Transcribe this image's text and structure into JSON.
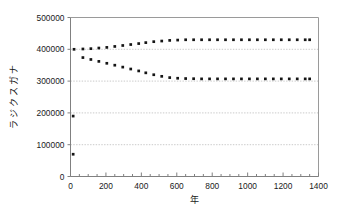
{
  "chart_data": {
    "type": "scatter",
    "title": "",
    "xlabel": "年",
    "ylabel": "ナガスクジラ",
    "xlim": [
      0,
      1400
    ],
    "ylim": [
      0,
      500000
    ],
    "xticks": [
      0,
      200,
      400,
      600,
      800,
      1000,
      1200,
      1400
    ],
    "xtick_labels": [
      "0",
      "200",
      "400",
      "600",
      "800",
      "1000",
      "1200",
      "1400"
    ],
    "yticks": [
      0,
      100000,
      200000,
      300000,
      400000,
      500000
    ],
    "ytick_labels": [
      "0",
      "100000",
      "200000",
      "300000",
      "400000",
      "500000"
    ],
    "grid": "horizontal-dotted",
    "legend": "none",
    "marker": "filled-square",
    "marker_color": "#151515",
    "series": [
      {
        "name": "upper-trajectory",
        "x": [
          20,
          70,
          115,
          160,
          205,
          250,
          295,
          340,
          385,
          425,
          470,
          515,
          560,
          605,
          650,
          695,
          740,
          785,
          830,
          875,
          920,
          965,
          1010,
          1055,
          1100,
          1145,
          1190,
          1235,
          1280,
          1325,
          1350
        ],
        "y": [
          400000,
          401000,
          402000,
          404000,
          406000,
          409000,
          412000,
          415000,
          418000,
          421000,
          424000,
          426000,
          428000,
          429000,
          430000,
          430000,
          430000,
          430000,
          430000,
          430000,
          430000,
          430000,
          430000,
          430000,
          430000,
          430000,
          430000,
          430000,
          430000,
          430000,
          430000
        ]
      },
      {
        "name": "lower-trajectory",
        "x": [
          70,
          115,
          160,
          205,
          250,
          295,
          340,
          385,
          425,
          470,
          515,
          560,
          605,
          650,
          695,
          740,
          785,
          830,
          875,
          920,
          965,
          1010,
          1055,
          1100,
          1145,
          1190,
          1235,
          1280,
          1325,
          1350
        ],
        "y": [
          374000,
          368000,
          362000,
          356000,
          350000,
          344000,
          338000,
          332000,
          326000,
          320000,
          315000,
          311000,
          309000,
          308000,
          307500,
          307000,
          307000,
          307000,
          307000,
          307000,
          307000,
          307000,
          307000,
          307000,
          307000,
          307000,
          307000,
          307000,
          307000,
          307000
        ]
      },
      {
        "name": "initial-points",
        "x": [
          15,
          15
        ],
        "y": [
          190000,
          70000
        ]
      }
    ]
  }
}
